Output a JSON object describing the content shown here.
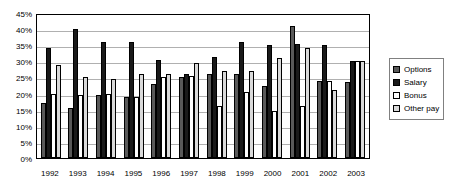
{
  "chart_data": {
    "type": "bar",
    "title": "",
    "subtitle": "",
    "xlabel": "",
    "ylabel": "",
    "ylim": [
      0,
      45
    ],
    "y_tick_labels": [
      "45%",
      "40%",
      "35%",
      "30%",
      "25%",
      "20%",
      "15%",
      "10%",
      "5%",
      "0%"
    ],
    "y_tick_values": [
      45,
      40,
      35,
      30,
      25,
      20,
      15,
      10,
      5,
      0
    ],
    "grid": true,
    "legend_position": "right",
    "categories": [
      "1992",
      "1993",
      "1994",
      "1995",
      "1996",
      "1997",
      "1998",
      "1999",
      "2000",
      "2001",
      "2002",
      "2003"
    ],
    "series": [
      {
        "name": "Options",
        "color": "#595959",
        "values": [
          17,
          15.5,
          19.5,
          19,
          23,
          25,
          26,
          26,
          22.5,
          41,
          24,
          23.5
        ]
      },
      {
        "name": "Salary",
        "color": "#1a1a1a",
        "values": [
          34,
          40,
          36,
          36,
          30.5,
          26,
          31.5,
          36,
          35,
          35.5,
          35,
          30
        ]
      },
      {
        "name": "Bonus",
        "color": "#ffffff",
        "values": [
          20,
          19.5,
          20,
          19,
          25,
          25.5,
          16,
          20.5,
          14.5,
          16,
          24,
          30
        ]
      },
      {
        "name": "Other pay",
        "color": "#d9d9d9",
        "values": [
          29,
          25,
          24.5,
          26,
          26,
          29.5,
          27,
          27,
          31,
          34,
          21,
          30
        ]
      }
    ]
  },
  "legend": {
    "items": [
      {
        "label": "Options"
      },
      {
        "label": "Salary"
      },
      {
        "label": "Bonus"
      },
      {
        "label": "Other pay"
      }
    ]
  }
}
